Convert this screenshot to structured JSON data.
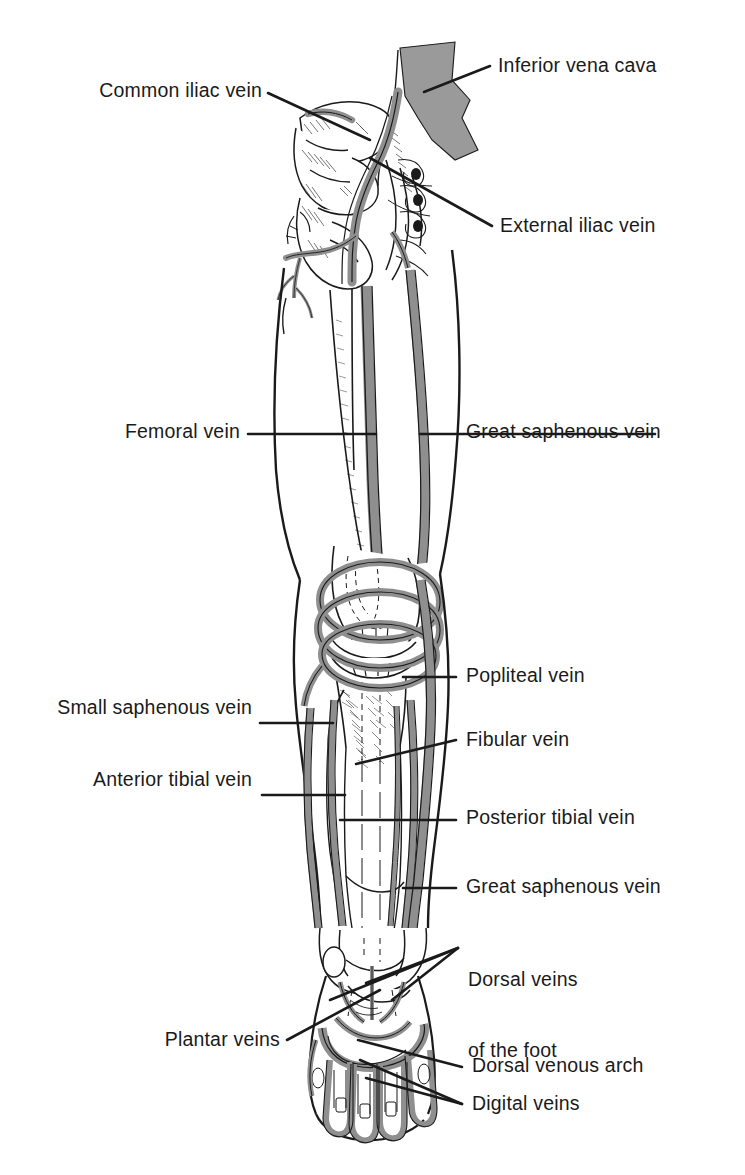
{
  "figure": {
    "background_color": "#ffffff",
    "ink_color": "#1a1a1a",
    "vein_fill_color": "#8f8f8f",
    "vena_cava_fill_color": "#9a9a9a",
    "bone_fill_color": "#ffffff"
  },
  "labels": {
    "common_iliac_vein": "Common iliac vein",
    "inferior_vena_cava": "Inferior vena cava",
    "external_iliac_vein": "External iliac vein",
    "femoral_vein": "Femoral vein",
    "great_saphenous_vein_thigh": "Great saphenous vein",
    "popliteal_vein": "Popliteal vein",
    "small_saphenous_vein": "Small saphenous vein",
    "fibular_vein": "Fibular vein",
    "anterior_tibial_vein": "Anterior tibial vein",
    "posterior_tibial_vein": "Posterior tibial vein",
    "great_saphenous_vein_leg": "Great saphenous vein",
    "dorsal_veins_of_the_foot_line1": "Dorsal veins",
    "dorsal_veins_of_the_foot_line2": "of the foot",
    "plantar_veins": "Plantar veins",
    "dorsal_venous_arch": "Dorsal venous arch",
    "digital_veins": "Digital veins"
  }
}
